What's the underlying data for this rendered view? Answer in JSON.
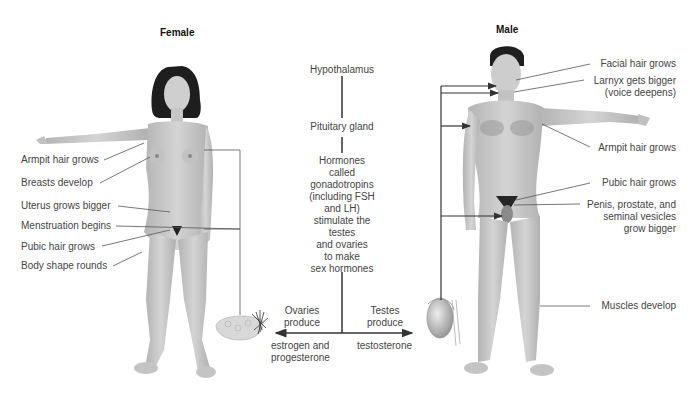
{
  "female": {
    "title": "Female",
    "labels": [
      "Armpit hair grows",
      "Breasts develop",
      "Uterus grows bigger",
      "Menstruation begins",
      "Pubic hair grows",
      "Body shape rounds"
    ]
  },
  "male": {
    "title": "Male",
    "labels": [
      "Facial hair grows",
      "Larnyx gets bigger",
      "(voice deepens)",
      "Armpit hair grows",
      "Pubic hair grows",
      "Penis, prostate, and",
      "seminal vesicles",
      "grow bigger",
      "Muscles develop"
    ]
  },
  "pathway": {
    "hypothalamus": "Hypothalamus",
    "pituitary": "Pituitary gland",
    "hormones_lines": [
      "Hormones",
      "called",
      "gonadotropins",
      "(including FSH",
      "and LH)",
      "stimulate the",
      "testes",
      "and ovaries",
      "to make",
      "sex hormones"
    ],
    "ovaries_produce": [
      "Ovaries",
      "produce"
    ],
    "testes_produce": [
      "Testes",
      "produce"
    ],
    "estrogen": [
      "estrogen and",
      "progesterone"
    ],
    "testosterone": "testosterone"
  },
  "colors": {
    "skin": "#c9c9c9",
    "skin_dark": "#a9a9a9",
    "hair": "#1e1e1e",
    "line": "#555555",
    "text": "#444444"
  }
}
